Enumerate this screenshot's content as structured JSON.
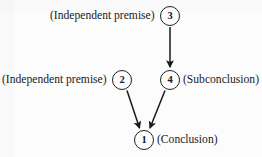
{
  "diagram": {
    "type": "argument-map",
    "background_color": "#fcfcfc",
    "ink_color": "#1a1a1a",
    "nodes": [
      {
        "id": "3",
        "number": "3",
        "label": "(Independent premise)",
        "label_side": "left",
        "cx": 170,
        "cy": 16,
        "r": 10
      },
      {
        "id": "2",
        "number": "2",
        "label": "(Independent premise)",
        "label_side": "left",
        "cx": 122,
        "cy": 80,
        "r": 10
      },
      {
        "id": "4",
        "number": "4",
        "label": "(Subconclusion)",
        "label_side": "right",
        "cx": 170,
        "cy": 80,
        "r": 10
      },
      {
        "id": "1",
        "number": "1",
        "label": "(Conclusion)",
        "label_side": "right",
        "cx": 144,
        "cy": 140,
        "r": 10
      }
    ],
    "arrows": [
      {
        "from": "3",
        "to": "4",
        "orientation": "vertical"
      },
      {
        "from": "2",
        "to": "1",
        "orientation": "diagonal-right-down"
      },
      {
        "from": "4",
        "to": "1",
        "orientation": "diagonal-left-down"
      }
    ]
  }
}
